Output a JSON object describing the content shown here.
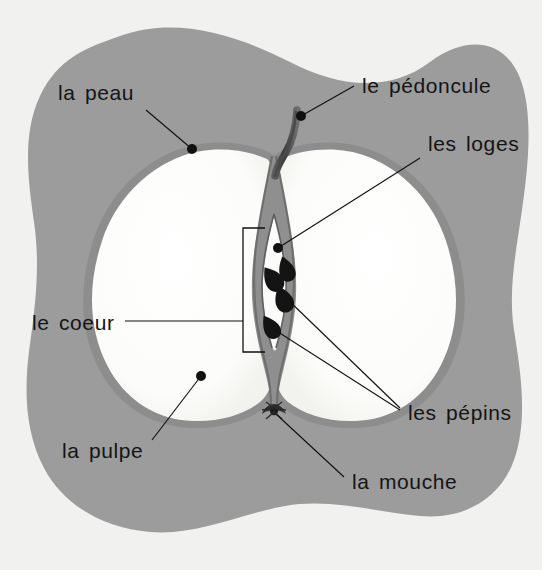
{
  "diagram": {
    "background_color": "#f1f1ef",
    "blob_color": "#9c9c9c",
    "flesh_color": "#fcfcfa",
    "skin_color": "#8a8a8a",
    "core_line_color": "#7d7d7d",
    "seed_color": "#141414",
    "label_color": "#141414",
    "leader_color": "#111111",
    "width": 542,
    "height": 570
  },
  "labels": [
    {
      "id": "la-peau",
      "text": "la peau",
      "text_x": 58,
      "text_y": 100,
      "anchor": "start",
      "target_x": 192,
      "target_y": 149,
      "line_from_x": 146,
      "line_from_y": 110,
      "has_dot": true
    },
    {
      "id": "le-pedoncule",
      "text": "le pédoncule",
      "text_x": 362,
      "text_y": 93,
      "anchor": "start",
      "target_x": 301,
      "target_y": 116,
      "line_from_x": 354,
      "line_from_y": 86,
      "has_dot": true
    },
    {
      "id": "les-loges",
      "text": "les loges",
      "text_x": 428,
      "text_y": 151,
      "anchor": "start",
      "target_x": 278,
      "target_y": 248,
      "line_from_x": 420,
      "line_from_y": 158,
      "has_dot": true
    },
    {
      "id": "le-coeur",
      "text": "le coeur",
      "text_x": 32,
      "text_y": 330,
      "anchor": "start",
      "target_x": 243,
      "target_y": 321,
      "line_from_x": 125,
      "line_from_y": 321,
      "has_dot": false
    },
    {
      "id": "la-pulpe",
      "text": "la pulpe",
      "text_x": 62,
      "text_y": 458,
      "anchor": "start",
      "target_x": 201,
      "target_y": 376,
      "line_from_x": 152,
      "line_from_y": 440,
      "has_dot": true
    },
    {
      "id": "les-pepins",
      "text": "les pépins",
      "text_x": 408,
      "text_y": 420,
      "anchor": "start",
      "target_x": 283,
      "target_y": 293,
      "target2_x": 277,
      "target2_y": 327,
      "line_from_x": 400,
      "line_from_y": 408,
      "has_dot": false
    },
    {
      "id": "la-mouche",
      "text": "la mouche",
      "text_x": 352,
      "text_y": 489,
      "anchor": "start",
      "target_x": 274,
      "target_y": 412,
      "line_from_x": 344,
      "line_from_y": 477,
      "has_dot": true
    }
  ],
  "seeds": [
    {
      "id": "seed-1",
      "cx": 272,
      "cy": 274,
      "rot": -28
    },
    {
      "id": "seed-2",
      "cx": 287,
      "cy": 266,
      "rot": -15
    },
    {
      "id": "seed-3",
      "cx": 283,
      "cy": 298,
      "rot": -22
    },
    {
      "id": "seed-4",
      "cx": 271,
      "cy": 324,
      "rot": -30
    }
  ],
  "core_bracket": {
    "id": "le-coeur-bracket",
    "left_x": 243,
    "top_y": 228,
    "bottom_y": 352,
    "arm_length": 22
  }
}
